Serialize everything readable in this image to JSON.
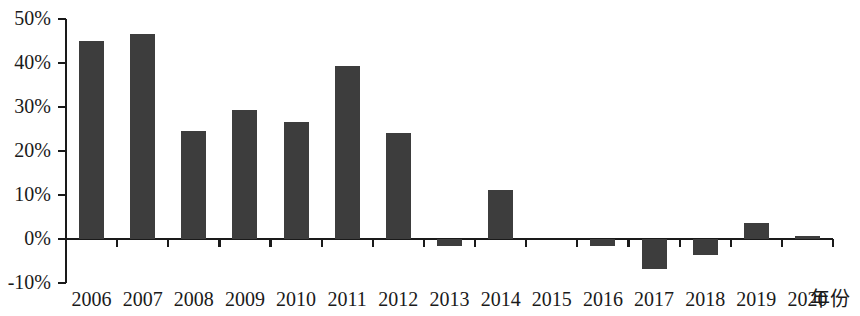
{
  "chart_data": {
    "type": "bar",
    "title": "",
    "subtitle": "",
    "xlabel": "年份",
    "ylabel": "",
    "categories": [
      "2006",
      "2007",
      "2008",
      "2009",
      "2010",
      "2011",
      "2012",
      "2013",
      "2014",
      "2015",
      "2016",
      "2017",
      "2018",
      "2019",
      "2020"
    ],
    "values": [
      45.0,
      46.5,
      24.5,
      29.3,
      26.7,
      39.4,
      24.0,
      -1.5,
      11.2,
      0.0,
      -1.7,
      -6.8,
      -3.7,
      3.6,
      0.6
    ],
    "ylim": [
      -10,
      50
    ],
    "ytick_values": [
      50,
      40,
      30,
      20,
      10,
      0,
      -10
    ],
    "ytick_labels": [
      "50%",
      "40%",
      "30%",
      "20%",
      "10%",
      "0%",
      "-10%"
    ],
    "grid": false,
    "legend": false,
    "legend_position": "none",
    "bar_color": "#3d3d3d",
    "axis_color": "#1a1a1a",
    "background_color": "#ffffff"
  }
}
